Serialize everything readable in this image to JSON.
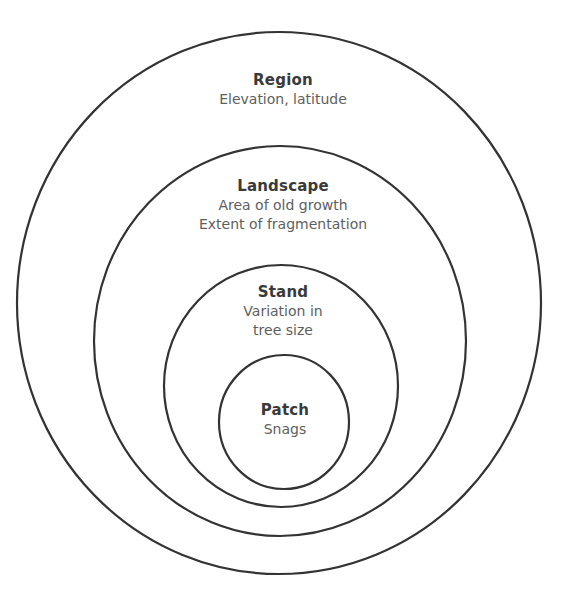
{
  "diagram": {
    "stroke_color": "#333333",
    "levels": [
      {
        "name": "Region",
        "description": "Elevation, latitude"
      },
      {
        "name": "Landscape",
        "description": "Area of old growth\nExtent of fragmentation"
      },
      {
        "name": "Stand",
        "description": "Variation in\ntree size"
      },
      {
        "name": "Patch",
        "description": "Snags"
      }
    ]
  }
}
